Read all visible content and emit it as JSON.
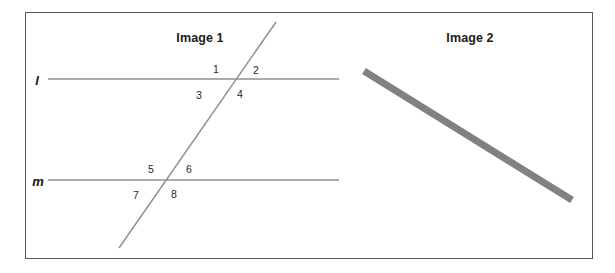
{
  "figure": {
    "width": 615,
    "height": 273,
    "background": "#ffffff",
    "border_color": "#555a5e"
  },
  "panels": [
    {
      "id": "image-1",
      "title": "Image 1"
    },
    {
      "id": "image-2",
      "title": "Image 2"
    }
  ],
  "image1": {
    "title": "Image 1",
    "line_color": "#8d9196",
    "lines": [
      {
        "name": "l",
        "label": "l",
        "type": "horizontal",
        "x1": 48,
        "y1": 79,
        "x2": 339,
        "y2": 79
      },
      {
        "name": "m",
        "label": "m",
        "type": "horizontal",
        "x1": 48,
        "y1": 180,
        "x2": 339,
        "y2": 180
      },
      {
        "name": "transversal",
        "label": "",
        "type": "transversal",
        "x1": 119,
        "y1": 248,
        "x2": 276,
        "y2": 22
      }
    ],
    "intersections": [
      {
        "line": "l",
        "x": 222,
        "y": 79
      },
      {
        "line": "m",
        "x": 152,
        "y": 180
      }
    ],
    "angles": [
      {
        "label": "1",
        "x": 216,
        "y": 69,
        "position": "upper-left",
        "at_line": "l"
      },
      {
        "label": "2",
        "x": 256,
        "y": 70,
        "position": "upper-right",
        "at_line": "l"
      },
      {
        "label": "3",
        "x": 199,
        "y": 95,
        "position": "lower-left",
        "at_line": "l"
      },
      {
        "label": "4",
        "x": 240,
        "y": 94,
        "position": "lower-right",
        "at_line": "l"
      },
      {
        "label": "5",
        "x": 151,
        "y": 169,
        "position": "upper-left",
        "at_line": "m"
      },
      {
        "label": "6",
        "x": 189,
        "y": 169,
        "position": "upper-right",
        "at_line": "m"
      },
      {
        "label": "7",
        "x": 136,
        "y": 195,
        "position": "lower-left",
        "at_line": "m"
      },
      {
        "label": "8",
        "x": 174,
        "y": 194,
        "position": "lower-right",
        "at_line": "m"
      }
    ]
  },
  "image2": {
    "title": "Image 2",
    "segment": {
      "name": "thick-segment",
      "x1": 364,
      "y1": 71,
      "x2": 572,
      "y2": 200,
      "stroke_width": 7,
      "color": "#7f8184"
    }
  }
}
